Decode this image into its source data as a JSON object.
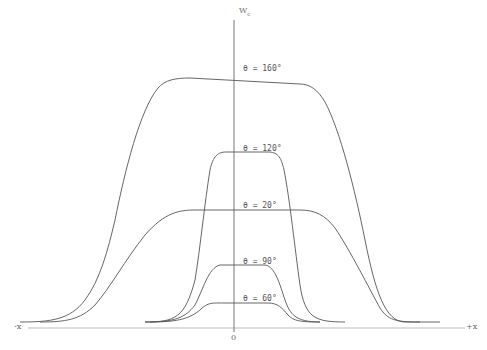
{
  "chart_data": {
    "type": "line",
    "title": "",
    "xlabel": "x",
    "ylabel": "W_c",
    "x_axis": {
      "left_label": "-x",
      "right_label": "+x",
      "origin_label": "0"
    },
    "y_axis": {
      "label_main": "W",
      "label_sub": "c"
    },
    "grid": false,
    "legend": "inline labels next to the y-axis",
    "series": [
      {
        "name": "θ = 160°",
        "label": "θ = 160°",
        "plateau_height_px": 252,
        "path": "M20,322 C50,322 70,320 85,300 C100,280 108,250 115,220 C125,170 140,110 158,88 C165,80 175,78 190,78 L300,84 C310,84 318,90 325,102 C340,130 355,190 365,240 C375,290 385,322 405,322 L440,322"
      },
      {
        "name": "θ = 120°",
        "label": "θ = 120°",
        "plateau_height_px": 185,
        "path": "M145,322 C175,322 185,318 195,280 C200,250 205,200 210,170 C213,156 218,152 226,152 L268,152 C277,152 281,156 284,170 C290,200 295,250 300,285 C305,318 315,322 345,322"
      },
      {
        "name": "θ = 20°",
        "label": "θ = 20°",
        "plateau_height_px": 128,
        "path": "M40,322 C65,322 80,320 95,305 C110,288 125,260 145,235 C165,212 180,210 195,210 L300,210 C315,210 325,215 335,228 C350,250 370,290 380,308 C388,320 395,322 420,322"
      },
      {
        "name": "θ = 90°",
        "label": "θ = 90°",
        "plateau_height_px": 58,
        "path": "M145,322 C175,322 185,318 195,305 C203,290 208,268 220,265 L265,265 C275,266 280,285 285,300 C290,314 295,322 320,322"
      },
      {
        "name": "θ = 60°",
        "label": "θ = 60°",
        "plateau_height_px": 38,
        "path": "M150,322 C180,322 190,318 200,310 C208,302 212,303 225,303 L268,303 C278,303 282,308 288,315 C294,321 300,322 320,322"
      }
    ],
    "label_positions": [
      {
        "text": "θ = 160°",
        "x": 243,
        "y": 64
      },
      {
        "text": "θ = 120°",
        "x": 243,
        "y": 144
      },
      {
        "text": "θ = 20°",
        "x": 243,
        "y": 201
      },
      {
        "text": "θ = 90°",
        "x": 243,
        "y": 257
      },
      {
        "text": "θ = 60°",
        "x": 243,
        "y": 294
      }
    ]
  }
}
